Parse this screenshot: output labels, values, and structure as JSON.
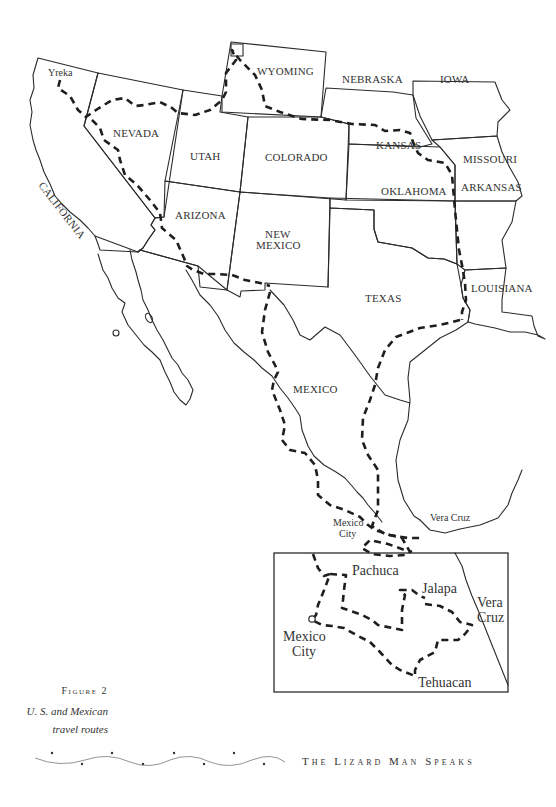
{
  "map": {
    "title": "U. S. and Mexican travel routes",
    "states": [
      {
        "id": "california",
        "label": "CALIFORNIA"
      },
      {
        "id": "nevada",
        "label": "NEVADA"
      },
      {
        "id": "utah",
        "label": "UTAH"
      },
      {
        "id": "arizona",
        "label": "ARIZONA"
      },
      {
        "id": "wyoming",
        "label": "WYOMING"
      },
      {
        "id": "colorado",
        "label": "COLORADO"
      },
      {
        "id": "new-mexico",
        "label_line1": "NEW",
        "label_line2": "MEXICO"
      },
      {
        "id": "nebraska",
        "label": "NEBRASKA"
      },
      {
        "id": "kansas",
        "label": "KANSAS"
      },
      {
        "id": "oklahoma",
        "label": "OKLAHOMA"
      },
      {
        "id": "texas",
        "label": "TEXAS"
      },
      {
        "id": "iowa",
        "label": "IOWA"
      },
      {
        "id": "missouri",
        "label": "MISSOURI"
      },
      {
        "id": "arkansas",
        "label": "ARKANSAS"
      },
      {
        "id": "louisiana",
        "label": "LOUISIANA"
      },
      {
        "id": "mexico",
        "label": "MEXICO"
      }
    ],
    "cities": {
      "yreka": "Yreka",
      "mexico_city_line1": "Mexico",
      "mexico_city_line2": "City",
      "vera_cruz": "Vera Cruz"
    },
    "inset": {
      "cities": {
        "pachuca": "Pachuca",
        "jalapa": "Jalapa",
        "vera_cruz_line1": "Vera",
        "vera_cruz_line2": "Cruz",
        "mexico_city_line1": "Mexico",
        "mexico_city_line2": "City",
        "tehuacan": "Tehuacan"
      }
    }
  },
  "caption": {
    "figure_label": "Figure 2",
    "line1": "U. S. and Mexican",
    "line2": "travel routes"
  },
  "footer": {
    "running_head": "The Lizard Man Speaks"
  }
}
